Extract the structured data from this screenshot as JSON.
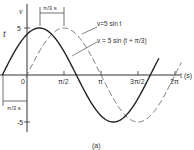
{
  "figure": {
    "caption": "(a)",
    "y_axis_label": "v",
    "side_label": "t",
    "x_axis_label": "t (s)",
    "y_ticks": [
      "5",
      "-5"
    ],
    "x_ticks": [
      "0",
      "π/2",
      "π",
      "3π/2",
      "2π"
    ],
    "shift_annotation_top": "π/3 s",
    "shift_annotation_left": "π/3 s",
    "curve_labels": {
      "dashed": "v=5 sin t",
      "solid": "v = 5 sin (t + π/3)"
    }
  },
  "chart_data": {
    "type": "line",
    "title": "",
    "xlabel": "t (s)",
    "ylabel": "v",
    "xlim": [
      -1.05,
      6.6
    ],
    "ylim": [
      -5,
      5
    ],
    "x_ticks": [
      "0",
      "π/2",
      "π",
      "3π/2",
      "2π"
    ],
    "series": [
      {
        "name": "v=5 sin t",
        "style": "dashed",
        "amplitude": 5,
        "phase": 0
      },
      {
        "name": "v = 5 sin (t + π/3)",
        "style": "solid",
        "amplitude": 5,
        "phase": 1.0472
      }
    ],
    "annotations": [
      "π/3 s (peak separation)",
      "π/3 s (zero-crossing lead)",
      "(a)"
    ]
  }
}
